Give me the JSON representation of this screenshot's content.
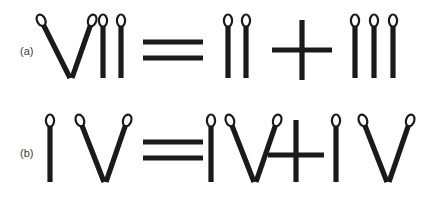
{
  "figure": {
    "type": "matchstick-puzzle-diagram",
    "background_color": "#ffffff",
    "stick_color": "#1a1a1a",
    "head_fill_color": "#ffffff",
    "head_stroke_color": "#1a1a1a",
    "label_color": "#3a3a3a",
    "rows": [
      {
        "label": "(a)",
        "equation_text": "VII = II + III",
        "left_numeral": "VII",
        "right_numeral_1": "II",
        "right_numeral_2": "III",
        "operator": "+",
        "relation": "=",
        "matchstick_count": 12,
        "groups": [
          {
            "name": "vii",
            "numeral": "VII",
            "sticks": [
              {
                "kind": "diagonal-left",
                "has_head": true,
                "x1": 40,
                "y1": 18,
                "x2": 70,
                "y2": 78
              },
              {
                "kind": "diagonal-right",
                "has_head": true,
                "x1": 93,
                "y1": 18,
                "x2": 72,
                "y2": 78
              },
              {
                "kind": "vertical",
                "has_head": true,
                "x1": 103,
                "y1": 18,
                "x2": 103,
                "y2": 78
              },
              {
                "kind": "vertical",
                "has_head": true,
                "x1": 121,
                "y1": 18,
                "x2": 121,
                "y2": 78
              }
            ]
          },
          {
            "name": "equals",
            "numeral": "=",
            "sticks": [
              {
                "kind": "horizontal",
                "has_head": false,
                "x1": 143,
                "y1": 42,
                "x2": 203,
                "y2": 42
              },
              {
                "kind": "horizontal",
                "has_head": false,
                "x1": 143,
                "y1": 58,
                "x2": 203,
                "y2": 58
              }
            ]
          },
          {
            "name": "ii",
            "numeral": "II",
            "sticks": [
              {
                "kind": "vertical",
                "has_head": true,
                "x1": 228,
                "y1": 18,
                "x2": 228,
                "y2": 78
              },
              {
                "kind": "vertical",
                "has_head": true,
                "x1": 246,
                "y1": 18,
                "x2": 246,
                "y2": 78
              }
            ]
          },
          {
            "name": "plus",
            "numeral": "+",
            "sticks": [
              {
                "kind": "vertical",
                "has_head": false,
                "x1": 302,
                "y1": 20,
                "x2": 302,
                "y2": 80
              },
              {
                "kind": "horizontal",
                "has_head": false,
                "x1": 272,
                "y1": 50,
                "x2": 332,
                "y2": 50
              }
            ]
          },
          {
            "name": "iii",
            "numeral": "III",
            "sticks": [
              {
                "kind": "vertical",
                "has_head": true,
                "x1": 355,
                "y1": 18,
                "x2": 355,
                "y2": 78
              },
              {
                "kind": "vertical",
                "has_head": true,
                "x1": 374,
                "y1": 18,
                "x2": 374,
                "y2": 78
              },
              {
                "kind": "vertical",
                "has_head": true,
                "x1": 393,
                "y1": 18,
                "x2": 393,
                "y2": 78
              }
            ]
          }
        ]
      },
      {
        "label": "(b)",
        "equation_text": "IV = IV + IV",
        "left_numeral": "IV",
        "right_numeral_1": "IV",
        "right_numeral_2": "IV",
        "operator": "+",
        "relation": "=",
        "matchstick_count": 13,
        "groups": [
          {
            "name": "iv-left",
            "numeral": "IV",
            "sticks": [
              {
                "kind": "vertical",
                "has_head": true,
                "x1": 50,
                "y1": 118,
                "x2": 50,
                "y2": 182
              },
              {
                "kind": "diagonal-left",
                "has_head": true,
                "x1": 79,
                "y1": 118,
                "x2": 104,
                "y2": 182
              },
              {
                "kind": "diagonal-right",
                "has_head": true,
                "x1": 128,
                "y1": 118,
                "x2": 106,
                "y2": 182
              }
            ]
          },
          {
            "name": "equals",
            "numeral": "=",
            "sticks": [
              {
                "kind": "horizontal",
                "has_head": false,
                "x1": 143,
                "y1": 142,
                "x2": 203,
                "y2": 142
              },
              {
                "kind": "horizontal",
                "has_head": false,
                "x1": 143,
                "y1": 158,
                "x2": 203,
                "y2": 158
              }
            ]
          },
          {
            "name": "iv-middle",
            "numeral": "IV",
            "sticks": [
              {
                "kind": "vertical",
                "has_head": true,
                "x1": 211,
                "y1": 118,
                "x2": 211,
                "y2": 182
              },
              {
                "kind": "diagonal-left",
                "has_head": true,
                "x1": 229,
                "y1": 118,
                "x2": 254,
                "y2": 182
              },
              {
                "kind": "diagonal-right",
                "has_head": true,
                "x1": 278,
                "y1": 118,
                "x2": 256,
                "y2": 182
              }
            ]
          },
          {
            "name": "plus",
            "numeral": "+",
            "sticks": [
              {
                "kind": "vertical",
                "has_head": false,
                "x1": 296,
                "y1": 120,
                "x2": 296,
                "y2": 182
              },
              {
                "kind": "horizontal",
                "has_head": false,
                "x1": 268,
                "y1": 155,
                "x2": 324,
                "y2": 155
              }
            ]
          },
          {
            "name": "iv-right",
            "numeral": "IV",
            "sticks": [
              {
                "kind": "vertical",
                "has_head": true,
                "x1": 336,
                "y1": 118,
                "x2": 336,
                "y2": 182
              },
              {
                "kind": "diagonal-left",
                "has_head": true,
                "x1": 362,
                "y1": 118,
                "x2": 387,
                "y2": 182
              },
              {
                "kind": "diagonal-right",
                "has_head": true,
                "x1": 411,
                "y1": 118,
                "x2": 389,
                "y2": 182
              }
            ]
          }
        ]
      }
    ]
  }
}
